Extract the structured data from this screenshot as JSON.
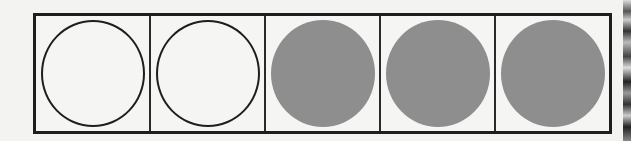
{
  "diagram": {
    "type": "fraction-circles",
    "total_cells": 5,
    "filled_count": 3,
    "empty_count": 2,
    "cells": [
      {
        "state": "empty"
      },
      {
        "state": "empty"
      },
      {
        "state": "filled"
      },
      {
        "state": "filled"
      },
      {
        "state": "filled"
      }
    ],
    "colors": {
      "outline": "#1e1e1e",
      "fill": "#8e8e8e",
      "background": "#f5f5f3"
    }
  }
}
